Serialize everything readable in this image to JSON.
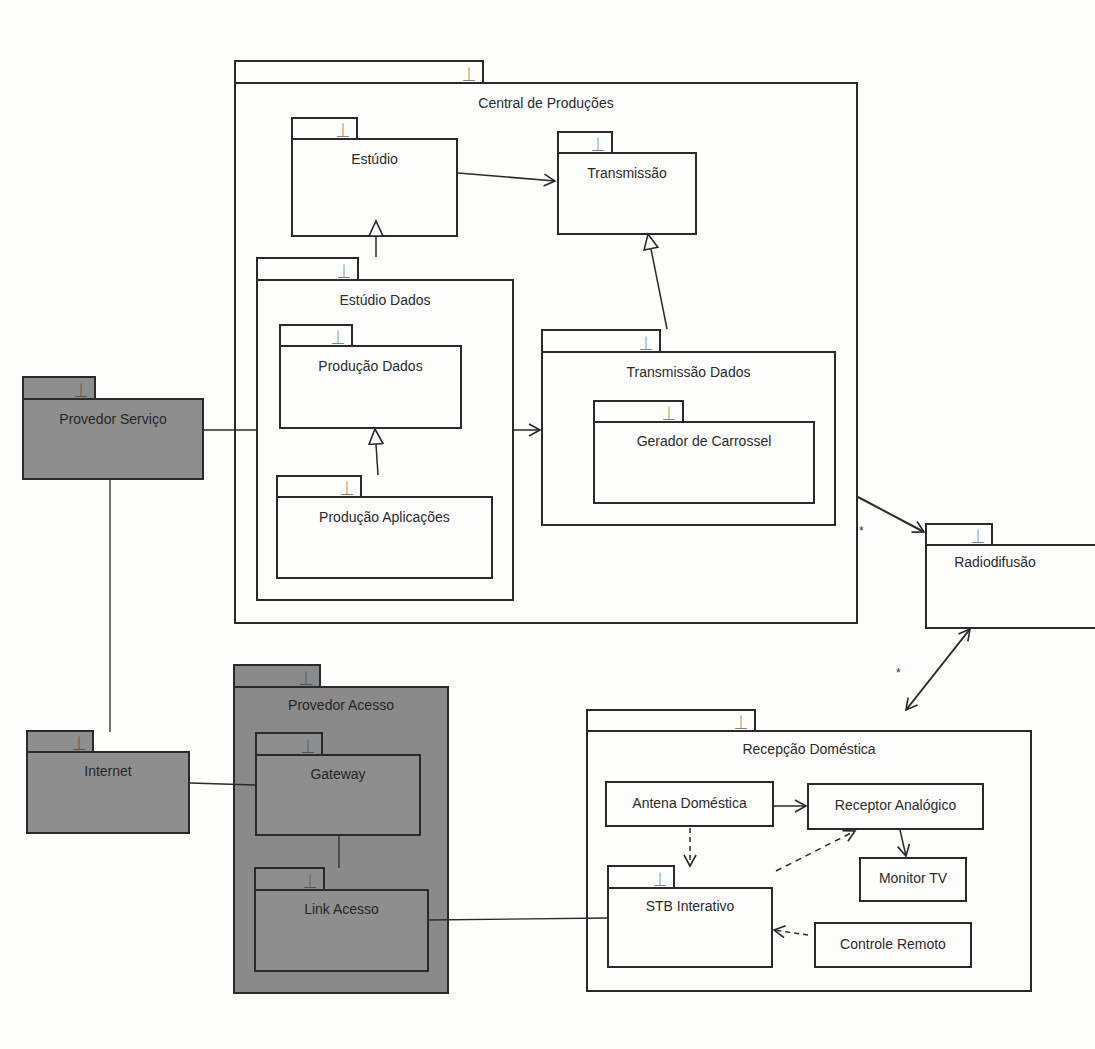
{
  "diagram": {
    "type": "UML package diagram",
    "packages": {
      "central_producoes": {
        "label": "Central de Produções"
      },
      "estudio": {
        "label": "Estúdio"
      },
      "transmissao": {
        "label": "Transmissão"
      },
      "estudio_dados": {
        "label": "Estúdio Dados"
      },
      "producao_dados": {
        "label": "Produção Dados"
      },
      "producao_aplicacoes": {
        "label": "Produção Aplicações"
      },
      "transmissao_dados": {
        "label": "Transmissão Dados"
      },
      "gerador_carrossel": {
        "label": "Gerador de Carrossel"
      },
      "radiodifusao": {
        "label": "Radiodifusão"
      },
      "provedor_servico": {
        "label": "Provedor Serviço"
      },
      "internet": {
        "label": "Internet"
      },
      "provedor_acesso": {
        "label": "Provedor Acesso"
      },
      "gateway": {
        "label": "Gateway"
      },
      "link_acesso": {
        "label": "Link Acesso"
      },
      "recepcao_domestica": {
        "label": "Recepção Doméstica"
      },
      "stb_interativo": {
        "label": "STB Interativo"
      }
    },
    "classes": {
      "antena_domestica": {
        "label": "Antena Doméstica"
      },
      "receptor_analogico": {
        "label": "Receptor Analógico"
      },
      "monitor_tv": {
        "label": "Monitor TV"
      },
      "controle_remoto": {
        "label": "Controle Remoto"
      }
    },
    "package_icon": "⏊",
    "multiplicities": {
      "central_to_radio": "*",
      "radio_to_recepcao": "*"
    },
    "relationships": [
      {
        "from": "Estúdio",
        "to": "Transmissão",
        "kind": "dependency-arrow"
      },
      {
        "from": "Estúdio Dados",
        "to": "Estúdio",
        "kind": "generalization"
      },
      {
        "from": "Transmissão Dados",
        "to": "Transmissão",
        "kind": "generalization"
      },
      {
        "from": "Produção Aplicações",
        "to": "Produção Dados",
        "kind": "generalization"
      },
      {
        "from": "Estúdio Dados",
        "to": "Transmissão Dados",
        "kind": "dependency-arrow"
      },
      {
        "from": "Central de Produções",
        "to": "Radiodifusão",
        "kind": "directed-association",
        "multiplicity": "*"
      },
      {
        "from": "Radiodifusão",
        "to": "Recepção Doméstica",
        "kind": "bidirectional-association",
        "multiplicity": "*"
      },
      {
        "from": "Provedor Serviço",
        "to": "Estúdio Dados",
        "kind": "association"
      },
      {
        "from": "Provedor Serviço",
        "to": "Internet",
        "kind": "association"
      },
      {
        "from": "Internet",
        "to": "Gateway",
        "kind": "association"
      },
      {
        "from": "Gateway",
        "to": "Link Acesso",
        "kind": "association"
      },
      {
        "from": "Link Acesso",
        "to": "STB Interativo",
        "kind": "association"
      },
      {
        "from": "Antena Doméstica",
        "to": "Receptor Analógico",
        "kind": "directed-association"
      },
      {
        "from": "Antena Doméstica",
        "to": "STB Interativo",
        "kind": "dependency"
      },
      {
        "from": "STB Interativo",
        "to": "Receptor Analógico",
        "kind": "dependency"
      },
      {
        "from": "Receptor Analógico",
        "to": "Monitor TV",
        "kind": "directed-association"
      },
      {
        "from": "Controle Remoto",
        "to": "STB Interativo",
        "kind": "dependency"
      }
    ],
    "colors": {
      "background": "#fdfdfc",
      "line": "#2a2a2a",
      "external_package_fill": "#8e8e8e"
    }
  }
}
